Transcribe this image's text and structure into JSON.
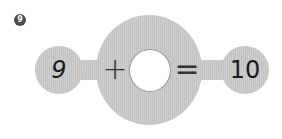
{
  "problem": {
    "number": "9",
    "left_operand": "9",
    "operator": "+",
    "blank": "",
    "equals": "=",
    "result": "10"
  },
  "colors": {
    "shape_fill": "#c8c8c8",
    "badge_bg": "#4a4a4a",
    "text": "#1a1a1a"
  }
}
